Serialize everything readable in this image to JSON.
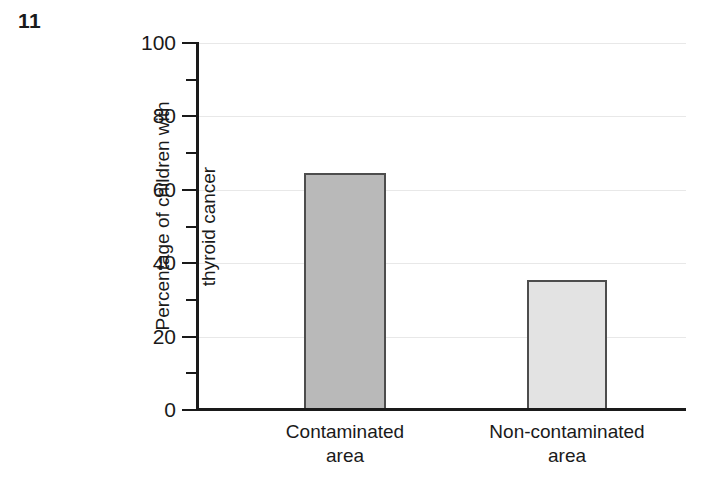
{
  "figure": {
    "number": "11"
  },
  "chart_data": {
    "type": "bar",
    "title": "",
    "xlabel": "",
    "ylabel": "Percentage of children with thyroid cancer",
    "ylabel_lines": [
      "Percentage of children with",
      "thyroid cancer"
    ],
    "categories": [
      "Contaminated area",
      "Non-contaminated area"
    ],
    "category_lines": [
      [
        "Contaminated",
        "area"
      ],
      [
        "Non-contaminated",
        "area"
      ]
    ],
    "values": [
      64.5,
      35.5
    ],
    "ylim": [
      0,
      100
    ],
    "yticks": [
      0,
      20,
      40,
      60,
      80,
      100
    ],
    "ytick_labels": [
      "0",
      "20",
      "40",
      "60",
      "80",
      "100"
    ],
    "yminor_ticks": [
      10,
      30,
      50,
      70,
      90
    ],
    "grid": true,
    "legend": "none",
    "bar_colors": [
      "#b9b9b9",
      "#e3e3e3"
    ],
    "bar_edge_color": "#4d4d4d",
    "grid_color": "#e8e8e8",
    "axis_color": "#1a1a1a"
  }
}
